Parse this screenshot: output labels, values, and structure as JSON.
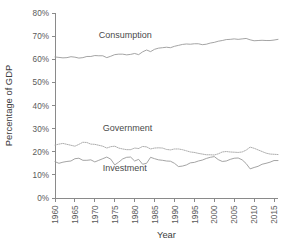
{
  "chart_data": {
    "type": "line",
    "title": "",
    "xlabel": "Year",
    "ylabel": "Percentage of GDP",
    "xlim": [
      1960,
      2016
    ],
    "ylim": [
      0,
      80
    ],
    "grid": false,
    "legend_position": "inline-labels",
    "y_tick_labels": [
      "0%",
      "10%",
      "20%",
      "30%",
      "40%",
      "50%",
      "60%",
      "70%",
      "80%"
    ],
    "y_tick_values": [
      0,
      10,
      20,
      30,
      40,
      50,
      60,
      70,
      80
    ],
    "x_tick_labels": [
      "1960",
      "1965",
      "1970",
      "1975",
      "1980",
      "1985",
      "1990",
      "1995",
      "2000",
      "2005",
      "2010",
      "2015"
    ],
    "x_tick_values": [
      1960,
      1965,
      1970,
      1975,
      1980,
      1985,
      1990,
      1995,
      2000,
      2005,
      2010,
      2015
    ],
    "x": [
      1960,
      1961,
      1962,
      1963,
      1964,
      1965,
      1966,
      1967,
      1968,
      1969,
      1970,
      1971,
      1972,
      1973,
      1974,
      1975,
      1976,
      1977,
      1978,
      1979,
      1980,
      1981,
      1982,
      1983,
      1984,
      1985,
      1986,
      1987,
      1988,
      1989,
      1990,
      1991,
      1992,
      1993,
      1994,
      1995,
      1996,
      1997,
      1998,
      1999,
      2000,
      2001,
      2002,
      2003,
      2004,
      2005,
      2006,
      2007,
      2008,
      2009,
      2010,
      2011,
      2012,
      2013,
      2014,
      2015,
      2016
    ],
    "series": [
      {
        "name": "Consumption",
        "style": "solid",
        "color": "#9a9a9a",
        "label_x": 1971,
        "label_y": 69,
        "values": [
          61.0,
          60.8,
          60.6,
          60.7,
          61.1,
          60.9,
          60.5,
          60.7,
          61.2,
          61.2,
          61.6,
          61.5,
          61.5,
          60.7,
          61.3,
          62.0,
          62.2,
          62.2,
          61.9,
          62.1,
          62.5,
          62.0,
          63.2,
          64.0,
          63.3,
          64.3,
          64.8,
          65.0,
          65.2,
          65.0,
          65.6,
          66.0,
          66.4,
          66.6,
          66.5,
          66.7,
          66.7,
          66.3,
          66.5,
          67.0,
          67.3,
          67.8,
          68.1,
          68.5,
          68.6,
          68.8,
          68.6,
          68.8,
          69.0,
          68.4,
          68.0,
          68.1,
          68.2,
          68.1,
          68.1,
          68.3,
          68.6
        ]
      },
      {
        "name": "Government",
        "style": "dotted",
        "color": "#a5a5a5",
        "label_x": 1972,
        "label_y": 29,
        "values": [
          22.9,
          23.3,
          23.6,
          23.2,
          22.8,
          22.4,
          23.2,
          24.1,
          24.0,
          23.3,
          23.2,
          22.8,
          22.4,
          21.6,
          22.2,
          22.4,
          21.6,
          21.2,
          20.9,
          20.9,
          21.6,
          21.4,
          22.3,
          22.1,
          21.2,
          21.6,
          21.7,
          21.6,
          21.0,
          20.8,
          21.2,
          21.2,
          20.9,
          20.4,
          19.9,
          19.7,
          19.3,
          19.0,
          18.7,
          18.7,
          18.6,
          19.1,
          19.9,
          20.1,
          19.9,
          19.8,
          19.7,
          19.9,
          20.7,
          22.0,
          21.5,
          20.8,
          20.1,
          19.4,
          19.0,
          18.9,
          18.8
        ]
      },
      {
        "name": "Investment",
        "style": "solid",
        "color": "#9a9a9a",
        "label_x": 1972,
        "label_y": 11.5,
        "values": [
          15.7,
          15.0,
          15.5,
          15.8,
          16.0,
          17.0,
          17.2,
          16.3,
          16.3,
          16.5,
          15.6,
          16.3,
          17.0,
          17.7,
          16.8,
          14.3,
          15.5,
          16.9,
          17.6,
          17.7,
          16.0,
          16.7,
          14.6,
          15.0,
          17.6,
          17.0,
          16.5,
          16.3,
          16.0,
          15.9,
          15.0,
          13.6,
          13.8,
          14.3,
          15.2,
          15.4,
          16.0,
          16.4,
          17.1,
          17.6,
          17.9,
          16.6,
          15.8,
          16.0,
          16.7,
          17.2,
          17.3,
          16.5,
          14.9,
          12.6,
          13.2,
          13.7,
          14.6,
          15.0,
          15.5,
          16.2,
          16.2
        ]
      }
    ]
  },
  "axis": {
    "y_title": "Percentage of GDP",
    "x_title": "Year"
  }
}
